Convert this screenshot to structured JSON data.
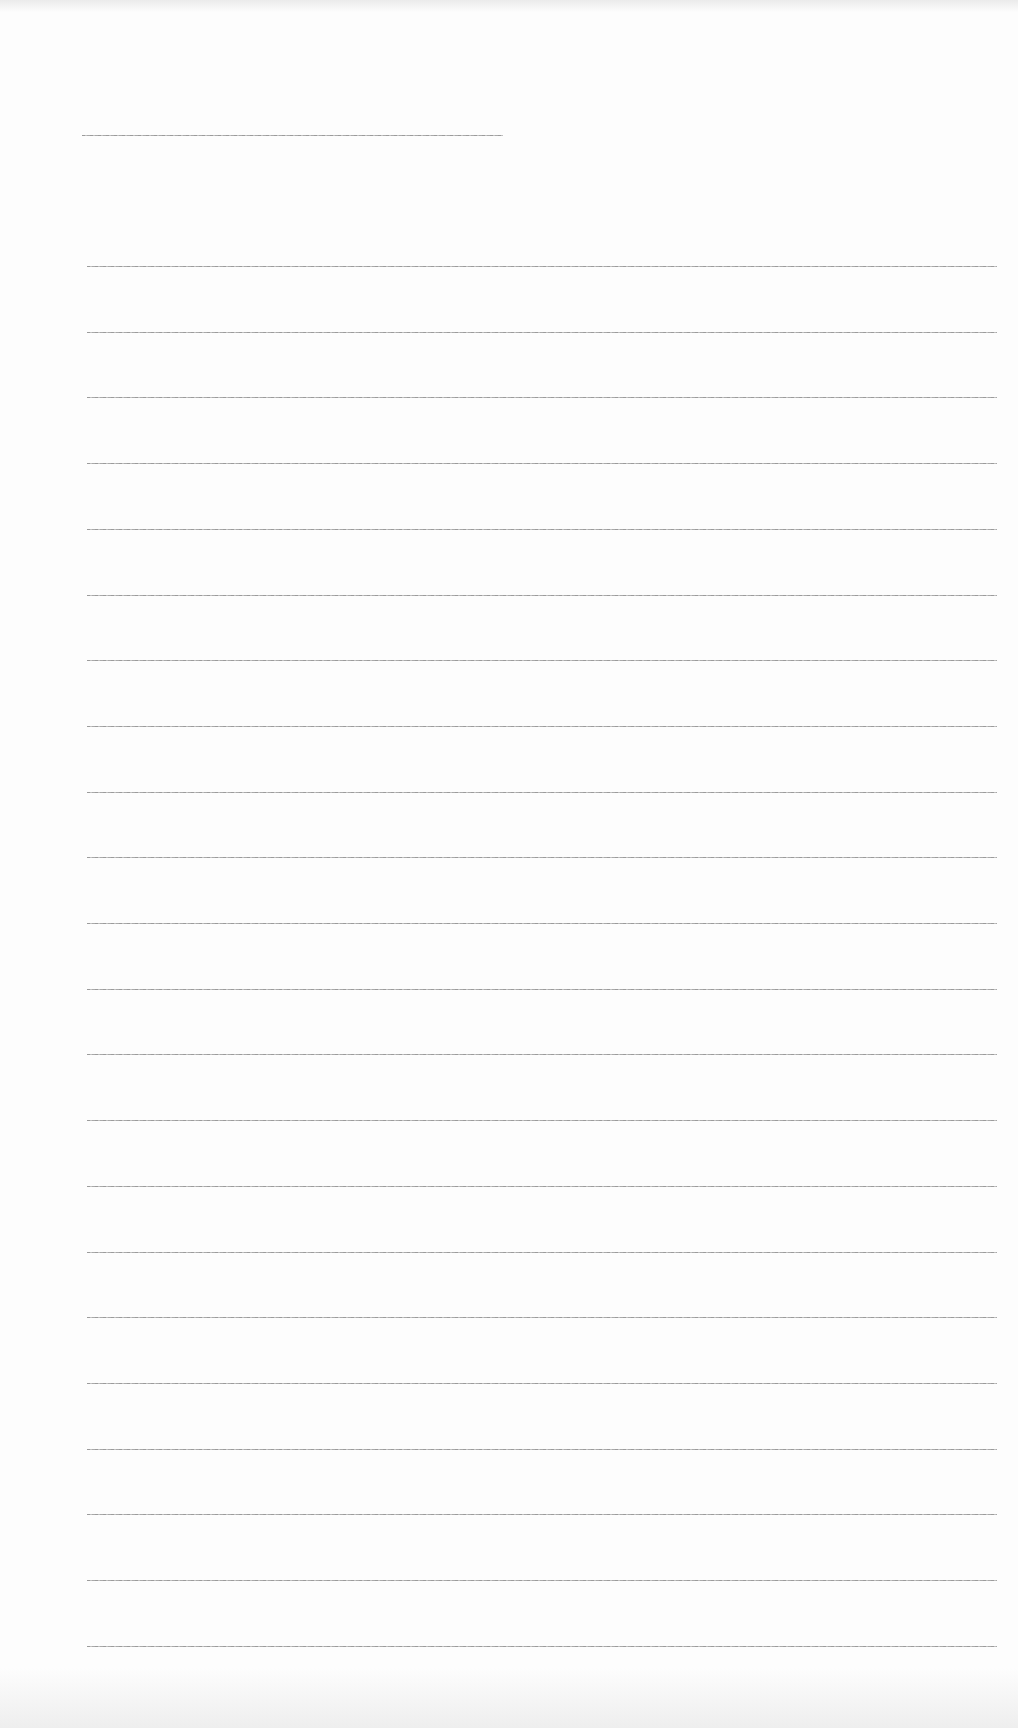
{
  "document": {
    "type": "blank lined paper",
    "header_line": {
      "x": 82,
      "y": 135,
      "width": 421
    },
    "ruled_lines": {
      "count": 22,
      "first_y": 266,
      "spacing": 65.7,
      "x_start": 87,
      "x_end": 997
    },
    "colors": {
      "paper": "#fdfdfd",
      "line": "#9a9a9a"
    }
  }
}
